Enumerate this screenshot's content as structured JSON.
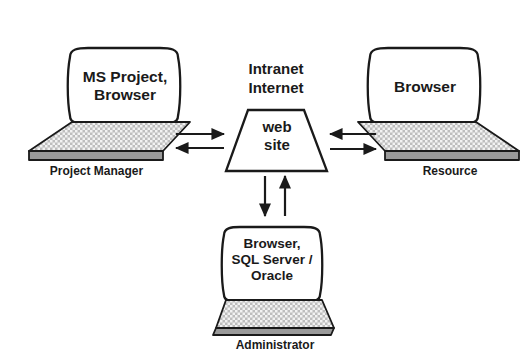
{
  "diagram": {
    "background_color": "#ffffff",
    "stroke_color": "#1a1a1a",
    "keyboard_fill": "#b4b4b4",
    "edge_fill": "#9a9a9a",
    "screen_fill": "#ffffff",
    "nodes": [
      {
        "id": "project-manager",
        "kind": "laptop",
        "screen_text": "MS Project,\nBrowser",
        "caption": "Project Manager"
      },
      {
        "id": "web-site",
        "kind": "trapezoid",
        "label_above": "Intranet\nInternet",
        "screen_text": "web\nsite"
      },
      {
        "id": "resource",
        "kind": "laptop",
        "screen_text": "Browser",
        "caption": "Resource"
      },
      {
        "id": "administrator",
        "kind": "laptop",
        "screen_text": "Browser,\nSQL Server /\nOracle",
        "caption": "Administrator"
      }
    ],
    "connectors": [
      {
        "id": "pm-to-site",
        "from": "project-manager",
        "to": "web-site",
        "direction": "right"
      },
      {
        "id": "site-to-pm",
        "from": "web-site",
        "to": "project-manager",
        "direction": "left"
      },
      {
        "id": "resource-to-site",
        "from": "resource",
        "to": "web-site",
        "direction": "left"
      },
      {
        "id": "site-to-resource",
        "from": "web-site",
        "to": "resource",
        "direction": "right"
      },
      {
        "id": "site-to-admin",
        "from": "web-site",
        "to": "administrator",
        "direction": "down"
      },
      {
        "id": "admin-to-site",
        "from": "administrator",
        "to": "web-site",
        "direction": "up"
      }
    ]
  }
}
